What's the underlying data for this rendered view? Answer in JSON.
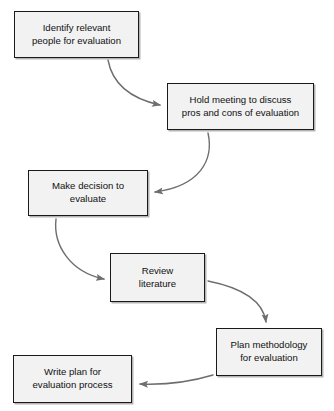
{
  "diagram": {
    "type": "flowchart",
    "canvas": {
      "width": 334,
      "height": 411
    },
    "style": {
      "node_fill": "#f2f2f2",
      "node_border": "#1a1a1a",
      "node_shadow": "#b4b4b4",
      "arrow_color": "#6e6e6e",
      "text_color": "#111111",
      "background": "#ffffff"
    },
    "nodes": [
      {
        "id": "identify-people",
        "label": "Identify relevant\npeople for evaluation",
        "x": 14,
        "y": 11,
        "w": 125,
        "h": 47
      },
      {
        "id": "hold-meeting",
        "label": "Hold meeting to discuss\npros and cons of evaluation",
        "x": 167,
        "y": 83,
        "w": 147,
        "h": 47
      },
      {
        "id": "make-decision",
        "label": "Make decision to\nevaluate",
        "x": 28,
        "y": 170,
        "w": 120,
        "h": 46
      },
      {
        "id": "review-literature",
        "label": "Review\nliterature",
        "x": 110,
        "y": 253,
        "w": 95,
        "h": 49
      },
      {
        "id": "plan-methodology",
        "label": "Plan methodology\nfor evaluation",
        "x": 216,
        "y": 328,
        "w": 106,
        "h": 48
      },
      {
        "id": "write-plan",
        "label": "Write plan for\nevaluation process",
        "x": 13,
        "y": 355,
        "w": 119,
        "h": 48
      }
    ],
    "edges": [
      {
        "id": "edge-identify-to-meeting",
        "from": "identify-people",
        "to": "hold-meeting",
        "label": "",
        "path": "M 108 60 C 112 82, 128 98, 160 105"
      },
      {
        "id": "edge-meeting-to-decision",
        "from": "hold-meeting",
        "to": "make-decision",
        "label": "",
        "path": "M 208 133 C 214 160, 200 186, 155 192"
      },
      {
        "id": "edge-decision-to-review",
        "from": "make-decision",
        "to": "review-literature",
        "label": "",
        "path": "M 56 219 C 53 245, 70 272, 104 279"
      },
      {
        "id": "edge-review-to-plan",
        "from": "review-literature",
        "to": "plan-methodology",
        "label": "",
        "path": "M 208 281 C 238 287, 263 299, 266 322"
      },
      {
        "id": "edge-plan-to-write",
        "from": "plan-methodology",
        "to": "write-plan",
        "label": "",
        "path": "M 213 375 C 190 382, 165 385, 140 384"
      }
    ]
  }
}
